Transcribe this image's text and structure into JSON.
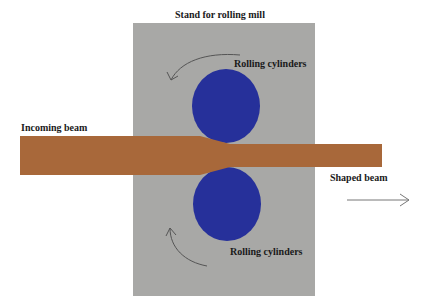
{
  "diagram": {
    "title": "Stand for rolling mill",
    "labels": {
      "top_cylinders": "Rolling cylinders",
      "bottom_cylinders": "Rolling cylinders",
      "incoming": "Incoming beam",
      "shaped": "Shaped beam"
    },
    "colors": {
      "stand": "#a8a8a6",
      "cylinder": "#26309a",
      "beam": "#a8683a",
      "arrow": "#555555"
    }
  }
}
